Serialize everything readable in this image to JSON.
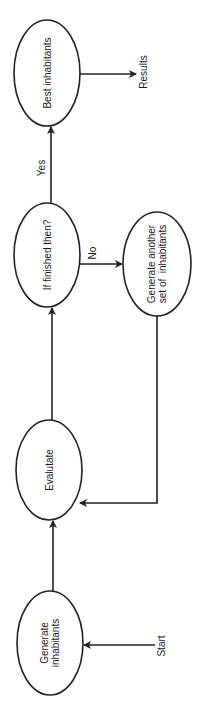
{
  "diagram": {
    "orientation": "rotated -90deg (flow reads bottom to top)",
    "nodes": [
      {
        "id": "generate",
        "label": "Generate inhabitants",
        "line1": "Generate",
        "line2": "inhabitants"
      },
      {
        "id": "evaluate",
        "label": "Evalutate"
      },
      {
        "id": "finished",
        "label": "If finished then?"
      },
      {
        "id": "another",
        "label": "Generate another set of inhabitants",
        "line1": "Generate another",
        "line2": "set of  inhabitants"
      },
      {
        "id": "best",
        "label": "Best inhabitants"
      }
    ],
    "terminals": {
      "start": "Start",
      "results": "Results"
    },
    "edges": [
      {
        "from": "start",
        "to": "generate",
        "label": ""
      },
      {
        "from": "generate",
        "to": "evaluate",
        "label": ""
      },
      {
        "from": "evaluate",
        "to": "finished",
        "label": ""
      },
      {
        "from": "finished",
        "to": "best",
        "label": "Yes"
      },
      {
        "from": "finished",
        "to": "another",
        "label": "No"
      },
      {
        "from": "another",
        "to": "evaluate",
        "label": ""
      },
      {
        "from": "best",
        "to": "results",
        "label": ""
      }
    ],
    "edge_labels": {
      "yes": "Yes",
      "no": "No"
    },
    "colors": {
      "stroke": "#222222",
      "text": "#1a1a1a",
      "background": "#ffffff"
    }
  }
}
